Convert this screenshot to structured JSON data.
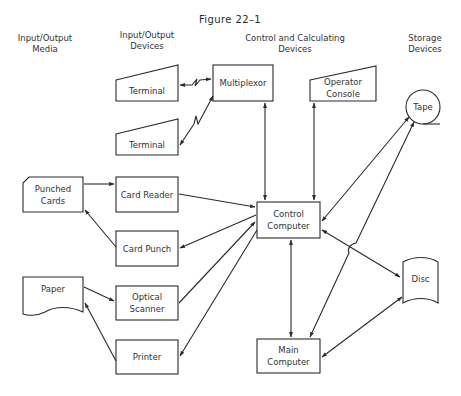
{
  "figure": {
    "title": "Figure 22–1"
  },
  "columns": [
    {
      "id": "media",
      "line1": "Input/Output",
      "line2": "Media"
    },
    {
      "id": "io_devices",
      "line1": "Input/Output",
      "line2": "Devices"
    },
    {
      "id": "control",
      "line1": "Control and Calculating",
      "line2": "Devices"
    },
    {
      "id": "storage",
      "line1": "Storage",
      "line2": "Devices"
    }
  ],
  "nodes": {
    "terminal1": {
      "label": "Terminal",
      "shape": "trapezoid"
    },
    "terminal2": {
      "label": "Terminal",
      "shape": "trapezoid"
    },
    "multiplexor": {
      "label": "Multiplexor",
      "shape": "rectangle"
    },
    "operator_console": {
      "line1": "Operator",
      "line2": "Console",
      "shape": "trapezoid"
    },
    "tape": {
      "label": "Tape",
      "shape": "circle-tape"
    },
    "punched_cards": {
      "line1": "Punched",
      "line2": "Cards",
      "shape": "card"
    },
    "card_reader": {
      "label": "Card Reader",
      "shape": "rectangle"
    },
    "card_punch": {
      "label": "Card Punch",
      "shape": "rectangle"
    },
    "control_computer": {
      "line1": "Control",
      "line2": "Computer",
      "shape": "rectangle"
    },
    "paper": {
      "label": "Paper",
      "shape": "document"
    },
    "optical_scanner": {
      "line1": "Optical",
      "line2": "Scanner",
      "shape": "rectangle"
    },
    "printer": {
      "label": "Printer",
      "shape": "rectangle"
    },
    "disc": {
      "label": "Disc",
      "shape": "disc"
    },
    "main_computer": {
      "line1": "Main",
      "line2": "Computer",
      "shape": "rectangle"
    }
  },
  "edges": [
    {
      "from": "multiplexor",
      "to": "terminal1",
      "direction": "both",
      "style": "lightning"
    },
    {
      "from": "multiplexor",
      "to": "terminal2",
      "direction": "both",
      "style": "lightning"
    },
    {
      "from": "multiplexor",
      "to": "control_computer",
      "direction": "both"
    },
    {
      "from": "operator_console",
      "to": "control_computer",
      "direction": "both"
    },
    {
      "from": "tape",
      "to": "control_computer",
      "direction": "both"
    },
    {
      "from": "tape",
      "to": "main_computer",
      "direction": "both"
    },
    {
      "from": "punched_cards",
      "to": "card_reader",
      "direction": "forward"
    },
    {
      "from": "card_punch",
      "to": "punched_cards",
      "direction": "forward"
    },
    {
      "from": "card_reader",
      "to": "control_computer",
      "direction": "forward"
    },
    {
      "from": "control_computer",
      "to": "card_punch",
      "direction": "forward"
    },
    {
      "from": "paper",
      "to": "optical_scanner",
      "direction": "forward"
    },
    {
      "from": "printer",
      "to": "paper",
      "direction": "forward"
    },
    {
      "from": "optical_scanner",
      "to": "control_computer",
      "direction": "forward"
    },
    {
      "from": "control_computer",
      "to": "printer",
      "direction": "forward"
    },
    {
      "from": "control_computer",
      "to": "disc",
      "direction": "both"
    },
    {
      "from": "control_computer",
      "to": "main_computer",
      "direction": "both"
    },
    {
      "from": "disc",
      "to": "main_computer",
      "direction": "both"
    }
  ]
}
